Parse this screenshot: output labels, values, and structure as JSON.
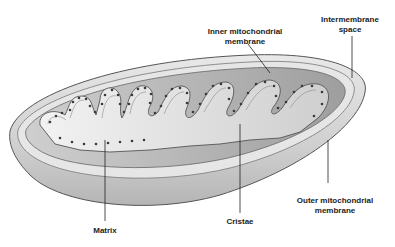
{
  "diagram": {
    "colors": {
      "shell": "#d9d9d9",
      "shell_dark": "#a9a9a9",
      "inner": "#c8c8c8",
      "cristae": "#e4e4e4",
      "particles": "#3a3a3a",
      "leader": "#222222"
    },
    "labels": {
      "inner_membrane": {
        "line1": "Inner mitochondrial",
        "line2": "membrane"
      },
      "intermembrane_space": {
        "line1": "Intermembrane",
        "line2": "space"
      },
      "outer_membrane": {
        "line1": "Outer mitochondrial",
        "line2": "membrane"
      },
      "cristae": "Cristae",
      "matrix": "Matrix"
    }
  }
}
